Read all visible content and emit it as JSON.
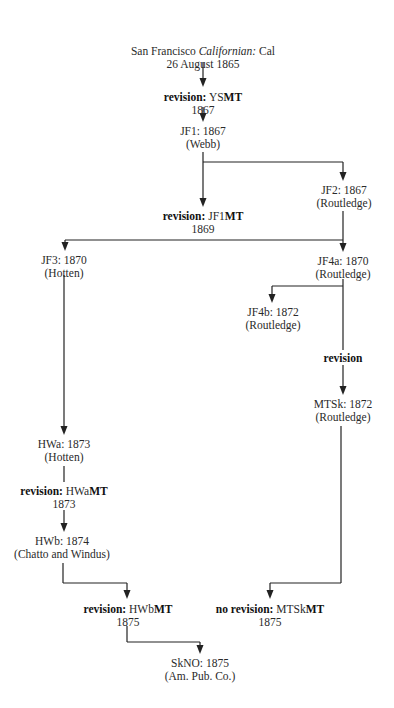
{
  "diagram": {
    "nodes": {
      "cal": {
        "line1_prefix": "San Francisco ",
        "line1_italic": "Californian:",
        "line1_suffix": " Cal",
        "line2": "26 August 1865"
      },
      "ysmt": {
        "bold": "revision:",
        "code": " YS",
        "code_bold": "MT",
        "line2": "1867"
      },
      "jf1": {
        "line1": "JF1: 1867",
        "line2": "(Webb)"
      },
      "jf2": {
        "line1": "JF2: 1867",
        "line2": "(Routledge)"
      },
      "jf1mt": {
        "bold": "revision:",
        "code": " JF1",
        "code_bold": "MT",
        "line2": "1869"
      },
      "jf3": {
        "line1": "JF3: 1870",
        "line2": "(Hotten)"
      },
      "jf4a": {
        "line1": "JF4a: 1870",
        "line2": "(Routledge)"
      },
      "jf4b": {
        "line1": "JF4b: 1872",
        "line2": "(Routledge)"
      },
      "rev": {
        "bold": "revision"
      },
      "mtsk": {
        "line1": "MTSk: 1872",
        "line2": "(Routledge)"
      },
      "hwa": {
        "line1": "HWa: 1873",
        "line2": "(Hotten)"
      },
      "hwamt": {
        "bold": "revision:",
        "code": " HWa",
        "code_bold": "MT",
        "line2": "1873"
      },
      "hwb": {
        "line1": "HWb: 1874",
        "line2": "(Chatto and Windus)"
      },
      "hwbmt": {
        "bold": "revision:",
        "code": " HWb",
        "code_bold": "MT",
        "line2": "1875"
      },
      "mtskmt": {
        "bold": "no revision:",
        "code": " MTSk",
        "code_bold": "MT",
        "line2": "1875"
      },
      "skno": {
        "line1": "SkNO: 1875",
        "line2": "(Am. Pub. Co.)"
      }
    }
  }
}
